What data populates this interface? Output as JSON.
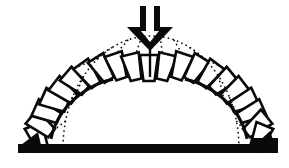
{
  "figure": {
    "name": "masonry-arch-collapse-mechanism-diagram",
    "background_color": "#ffffff",
    "ink_color": "#0a0a0a"
  },
  "canvas": {
    "width": 289,
    "height": 168
  },
  "chart_data": {
    "type": "diagram",
    "title": "",
    "elements": [
      "point-load-arrow",
      "deformed-voussoir-arch",
      "original-arch-dotted-outline",
      "displacement-tie-lines",
      "ground-bar"
    ]
  },
  "deformed_arch": {
    "center": [
      149,
      150
    ],
    "rx": 112,
    "ry": 90,
    "t_start_deg": 172,
    "t_end_deg": 8,
    "voussoir_count": 21,
    "half_height": 13,
    "half_width": 7,
    "taper_outer": 1.3,
    "taper_inner": 0.78,
    "stroke_width": 2.6,
    "inner_edge_stroke_width": 3,
    "inner_edge_ranges": [
      [
        8,
        68
      ],
      [
        112,
        172
      ]
    ],
    "crown_dip": {
      "amplitude": 8,
      "sigma_deg": 16,
      "center_deg": 90
    },
    "tilt_jitter_deg": [
      61,
      26,
      4,
      -3,
      3,
      -2,
      3,
      -2,
      2,
      -3,
      0,
      3,
      -2,
      2,
      -2,
      3,
      -3,
      2,
      -4,
      -26,
      -61
    ]
  },
  "original_arch_dotted": {
    "center": [
      151,
      148
    ],
    "rx": 88,
    "ry": 112,
    "stroke_width": 1.5,
    "dash": "1.6 3.2",
    "rung_angles_deg": [
      14,
      27,
      40,
      53,
      64,
      75,
      84,
      96,
      105,
      116,
      127,
      140,
      153,
      166
    ]
  },
  "ground": {
    "bar": {
      "x": 18,
      "y": 144,
      "width": 260,
      "height": 9
    },
    "right_step": {
      "x": 251,
      "y": 138,
      "width": 27,
      "height": 8
    },
    "left_wedge": [
      [
        21,
        145
      ],
      [
        41,
        145
      ],
      [
        38,
        132
      ]
    ],
    "right_wedge": [
      [
        275,
        145
      ],
      [
        255,
        145
      ],
      [
        270,
        131
      ]
    ]
  },
  "load_arrow": {
    "outer": [
      [
        140,
        6
      ],
      [
        160,
        6
      ],
      [
        160,
        27
      ],
      [
        173,
        27
      ],
      [
        150,
        51
      ],
      [
        127,
        27
      ],
      [
        140,
        27
      ]
    ],
    "hole": [
      [
        146,
        6
      ],
      [
        154,
        6
      ],
      [
        154,
        31
      ],
      [
        159,
        31
      ],
      [
        150,
        42
      ],
      [
        141,
        31
      ],
      [
        146,
        31
      ]
    ]
  },
  "crown_joint": {
    "x": 150,
    "y1": 50,
    "y2": 77,
    "stroke_width": 2.4
  }
}
